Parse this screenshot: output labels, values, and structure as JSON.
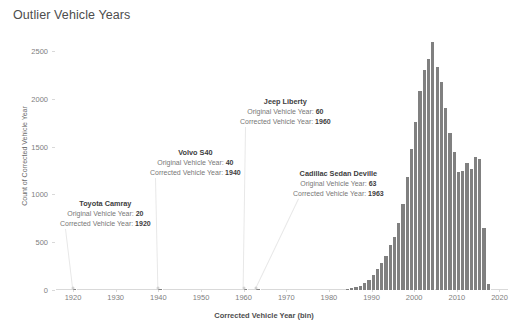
{
  "title": "Outlier Vehicle Years",
  "axes": {
    "ylabel": "Count of Corrected Vehicle Year",
    "xlabel": "Corrected Vehicle Year (bin)",
    "yticks": [
      "0",
      "500",
      "1000",
      "1500",
      "2000",
      "2500"
    ],
    "xticks": [
      "1920",
      "1930",
      "1940",
      "1950",
      "1960",
      "1970",
      "1980",
      "1990",
      "2000",
      "2010",
      "2020"
    ]
  },
  "colors": {
    "bar": "#808080",
    "text": "#4a4a4a",
    "tick": "#808080",
    "leader": "#e8e8e8",
    "background": "#ffffff"
  },
  "annotations": [
    {
      "name": "toyota-camray",
      "title": "Toyota  Camray",
      "original_label": "Original Vehicle Year:",
      "original_value": "20",
      "corrected_label": "Corrected Vehicle Year:",
      "corrected_value": "1920",
      "x_pct": 5.0,
      "box_left": 60,
      "box_top": 199
    },
    {
      "name": "volvo-s40",
      "title": "Volvo  S40",
      "original_label": "Original Vehicle Year:",
      "original_value": "40",
      "corrected_label": "Corrected Vehicle Year:",
      "corrected_value": "1940",
      "x_pct": 25.0,
      "box_left": 150,
      "box_top": 148
    },
    {
      "name": "jeep-liberty",
      "title": "Jeep  Liberty",
      "original_label": "Original Vehicle Year:",
      "original_value": "60",
      "corrected_label": "Corrected Vehicle Year:",
      "corrected_value": "1960",
      "x_pct": 45.0,
      "box_left": 240,
      "box_top": 97
    },
    {
      "name": "cadillac-sedan-deville",
      "title": "Cadillac  Sedan Deville",
      "original_label": "Original Vehicle Year:",
      "original_value": "63",
      "corrected_label": "Corrected Vehicle Year:",
      "corrected_value": "1963",
      "x_pct": 48.0,
      "box_left": 293,
      "box_top": 169
    }
  ],
  "chart_data": {
    "type": "bar",
    "title": "Outlier Vehicle Years",
    "xlabel": "Corrected Vehicle Year (bin)",
    "ylabel": "Count of Corrected Vehicle Year",
    "xlim": [
      1916,
      2022
    ],
    "ylim": [
      0,
      2700
    ],
    "grid": false,
    "legend": null,
    "bin_width": 1,
    "categories": [
      1920,
      1940,
      1960,
      1963,
      1984,
      1985,
      1986,
      1987,
      1988,
      1989,
      1990,
      1991,
      1992,
      1993,
      1994,
      1995,
      1996,
      1997,
      1998,
      1999,
      2000,
      2001,
      2002,
      2003,
      2004,
      2005,
      2006,
      2007,
      2008,
      2009,
      2010,
      2011,
      2012,
      2013,
      2014,
      2015,
      2016,
      2017
    ],
    "values": [
      8,
      8,
      8,
      8,
      10,
      18,
      30,
      45,
      70,
      110,
      160,
      215,
      280,
      360,
      470,
      560,
      700,
      900,
      1180,
      1480,
      1760,
      2080,
      2300,
      2420,
      2600,
      2330,
      2180,
      1900,
      1640,
      1440,
      1230,
      1250,
      1330,
      1270,
      1390,
      1370,
      650,
      60
    ]
  }
}
